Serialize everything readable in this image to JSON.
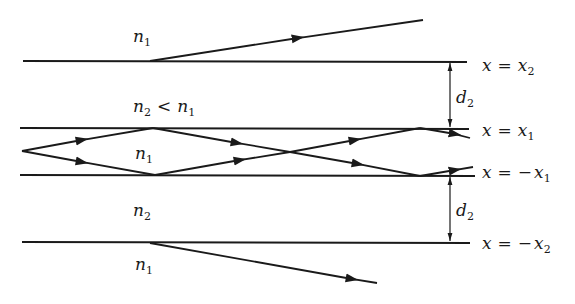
{
  "diagram": {
    "colors": {
      "ink": "#1a1a1a",
      "background": "#ffffff"
    },
    "regions": {
      "top_outer": {
        "symbol": "n",
        "subscript": "1"
      },
      "top_cladding": {
        "symbol": "n",
        "subscript": "2",
        "relation": "<",
        "rhs_symbol": "n",
        "rhs_subscript": "1"
      },
      "core": {
        "symbol": "n",
        "subscript": "1"
      },
      "bottom_cladding": {
        "symbol": "n",
        "subscript": "2"
      },
      "bottom_outer": {
        "symbol": "n",
        "subscript": "1"
      }
    },
    "boundaries": [
      {
        "label_var": "x",
        "eq": "=",
        "sign": "",
        "rhs_var": "x",
        "rhs_sub": "2"
      },
      {
        "label_var": "x",
        "eq": "=",
        "sign": "",
        "rhs_var": "x",
        "rhs_sub": "1"
      },
      {
        "label_var": "x",
        "eq": "=",
        "sign": "−",
        "rhs_var": "x",
        "rhs_sub": "1"
      },
      {
        "label_var": "x",
        "eq": "=",
        "sign": "−",
        "rhs_var": "x",
        "rhs_sub": "2"
      }
    ],
    "dimensions": [
      {
        "symbol": "d",
        "subscript": "2",
        "between": "x2 and x1"
      },
      {
        "symbol": "d",
        "subscript": "2",
        "between": "-x1 and -x2"
      }
    ],
    "rays": {
      "guided": "zig-zag rays inside core between x = x1 and x = -x1",
      "tunneling_top": "ray escaping into upper n1 region",
      "tunneling_bottom": "ray escaping into lower n1 region"
    }
  }
}
